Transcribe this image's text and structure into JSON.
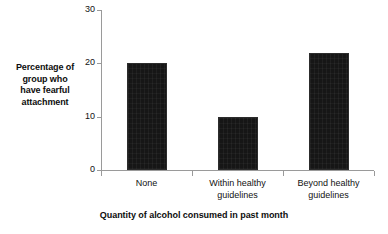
{
  "chart_data": {
    "type": "bar",
    "title": "",
    "subtitle": "",
    "categories": [
      "None",
      "Within healthy guidelines",
      "Beyond healthy guidelines"
    ],
    "values": [
      20,
      10,
      22
    ],
    "series": [
      {
        "name": "Percentage of group who have fearful attachment",
        "values": [
          20,
          10,
          22
        ]
      }
    ],
    "xlabel": "Quantity of alcohol consumed in past month",
    "ylabel": "Percentage of group who have fearful attachment",
    "ylim": [
      0,
      30
    ],
    "yticks": [
      0,
      10,
      20,
      30
    ],
    "ytick_labels": [
      "0",
      "10",
      "20",
      "30"
    ],
    "grid": false,
    "legend": false,
    "legend_position": "none",
    "bar_color": "#161616",
    "axis_color": "#9a9a9a",
    "background_color": "#ffffff"
  },
  "axes": {
    "y_title_lines": [
      "Percentage of",
      "group who",
      "have fearful",
      "attachment"
    ],
    "x_title": "Quantity of alcohol consumed in past month",
    "y_tick_labels": [
      "30",
      "20",
      "10",
      "0"
    ],
    "x_tick_label_lines": [
      [
        "None"
      ],
      [
        "Within healthy",
        "guidelines"
      ],
      [
        "Beyond healthy",
        "guidelines"
      ]
    ]
  }
}
